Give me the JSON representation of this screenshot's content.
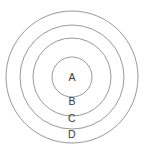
{
  "figure": {
    "background_color": "#ffffff",
    "stroke_color": "#8d8d8d",
    "label_color": "#3a3a3a",
    "center": {
      "x": 72,
      "y": 77
    }
  },
  "chart_data": {
    "type": "pie",
    "title": "",
    "subtitle": "",
    "xlabel": "",
    "ylabel": "",
    "grid": false,
    "legend": "none",
    "annotations": [
      "A",
      "B",
      "C",
      "D"
    ],
    "categories": [
      "A",
      "B",
      "C",
      "D"
    ],
    "values": [
      20,
      39,
      52,
      66
    ],
    "series": [
      {
        "name": "radius",
        "values": [
          20,
          39,
          52,
          66
        ]
      }
    ]
  },
  "rings": [
    {
      "id": "ring-a",
      "label": "A",
      "radius": 20,
      "label_x": 72,
      "label_y": 78
    },
    {
      "id": "ring-b",
      "label": "B",
      "radius": 39,
      "label_x": 72,
      "label_y": 102
    },
    {
      "id": "ring-c",
      "label": "C",
      "radius": 52,
      "label_x": 72,
      "label_y": 119
    },
    {
      "id": "ring-d",
      "label": "D",
      "radius": 66,
      "label_x": 72,
      "label_y": 135
    }
  ]
}
